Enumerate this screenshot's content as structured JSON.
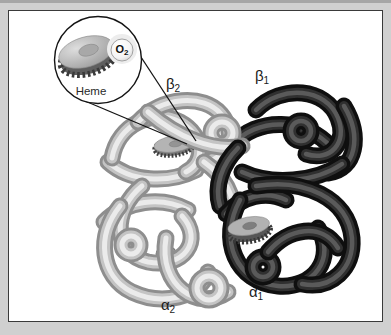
{
  "figure": {
    "inset": {
      "heme_label": "Heme",
      "o2": {
        "base": "O",
        "sub": "2"
      }
    },
    "labels": {
      "beta2": {
        "base": "β",
        "sub": "2"
      },
      "beta1": {
        "base": "β",
        "sub": "1"
      },
      "alpha2": {
        "base": "α",
        "sub": "2"
      },
      "alpha1": {
        "base": "α",
        "sub": "1"
      }
    }
  },
  "colors": {
    "background": "#d0d0d0",
    "panel": "#ffffff",
    "panel_border": "#3a3a3a",
    "line": "#141414",
    "light_subunit": "#c4c4c4",
    "dark_subunit": "#1a1a1a",
    "heme_disk_top": "#b8b8b8",
    "heme_disk_side": "#5e5e5e",
    "o2_halo": "#ededed",
    "text": "#1a1a1a"
  }
}
